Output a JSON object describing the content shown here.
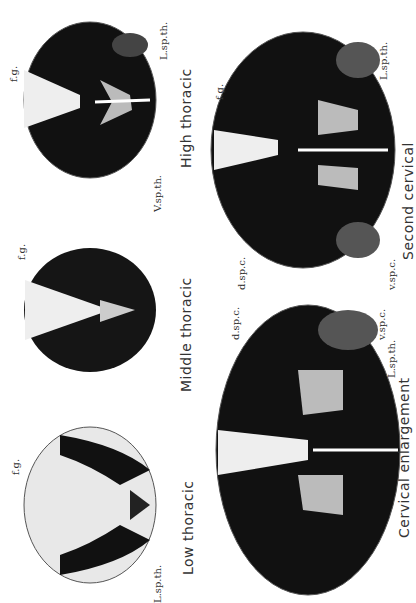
{
  "figure": {
    "sections": [
      {
        "caption": "High thoracic",
        "labels": {
          "fg": "f.g.",
          "lsp": "L.sp.th.",
          "vsp": "V.sp.th."
        }
      },
      {
        "caption": "Middle thoracic",
        "labels": {
          "fg": "f.g."
        }
      },
      {
        "caption": "Low thoracic",
        "labels": {
          "fg": "f.g.",
          "lsp": "L.sp.th."
        }
      },
      {
        "caption": "Second cervical",
        "labels": {
          "fg": "f.g.",
          "lsp": "L.sp.th.",
          "dspc": "d.sp.c.",
          "vspc": "v.sp.c."
        }
      },
      {
        "caption": "Cervical enlargement",
        "labels": {
          "dspc": "d.sp.c.",
          "vspc": "v.sp.c.",
          "lsp": "L.sp.th."
        }
      }
    ]
  }
}
